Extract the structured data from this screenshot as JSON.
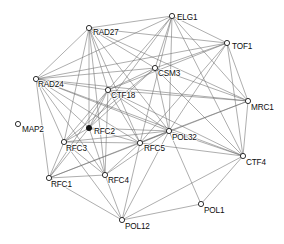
{
  "graph": {
    "title": "Gene interaction network",
    "type": "node-link-graph",
    "canvas": {
      "width": 284,
      "height": 244
    },
    "style": {
      "edge_color": "#6b6b6b",
      "node_stroke": "#1a1a1a",
      "node_fill": "#ffffff",
      "node_fill_highlight": "#111111",
      "background": "#ffffff",
      "node_radius": 2.6,
      "label_font_size": 8.2
    },
    "nodes": [
      {
        "id": "ELG1",
        "label": "ELG1",
        "x": 172,
        "y": 16,
        "filled": false,
        "label_dx": 5,
        "label_dy": 4
      },
      {
        "id": "RAD27",
        "label": "RAD27",
        "x": 89,
        "y": 28,
        "filled": false,
        "label_dx": 4,
        "label_dy": 7
      },
      {
        "id": "TOF1",
        "label": "TOF1",
        "x": 227,
        "y": 43,
        "filled": false,
        "label_dx": 5,
        "label_dy": 6
      },
      {
        "id": "CSM3",
        "label": "CSM3",
        "x": 155,
        "y": 68,
        "filled": false,
        "label_dx": 3,
        "label_dy": 8
      },
      {
        "id": "RAD24",
        "label": "RAD24",
        "x": 36,
        "y": 79,
        "filled": false,
        "label_dx": 2,
        "label_dy": 8
      },
      {
        "id": "CTF18",
        "label": "CTF18",
        "x": 108,
        "y": 90,
        "filled": false,
        "label_dx": 3,
        "label_dy": 8
      },
      {
        "id": "MRC1",
        "label": "MRC1",
        "x": 248,
        "y": 101,
        "filled": false,
        "label_dx": 3,
        "label_dy": 9
      },
      {
        "id": "MAP2",
        "label": "MAP2",
        "x": 18,
        "y": 124,
        "filled": false,
        "label_dx": 4,
        "label_dy": 8
      },
      {
        "id": "RFC2",
        "label": "RFC2",
        "x": 89,
        "y": 128,
        "filled": true,
        "label_dx": 5,
        "label_dy": 6
      },
      {
        "id": "POL32",
        "label": "POL32",
        "x": 169,
        "y": 131,
        "filled": false,
        "label_dx": 3,
        "label_dy": 9
      },
      {
        "id": "RFC3",
        "label": "RFC3",
        "x": 64,
        "y": 142,
        "filled": false,
        "label_dx": 2,
        "label_dy": 9
      },
      {
        "id": "RFC5",
        "label": "RFC5",
        "x": 140,
        "y": 143,
        "filled": false,
        "label_dx": 4,
        "label_dy": 8
      },
      {
        "id": "CTF4",
        "label": "CTF4",
        "x": 243,
        "y": 156,
        "filled": false,
        "label_dx": 3,
        "label_dy": 9
      },
      {
        "id": "RFC4",
        "label": "RFC4",
        "x": 105,
        "y": 175,
        "filled": false,
        "label_dx": 3,
        "label_dy": 8
      },
      {
        "id": "RFC1",
        "label": "RFC1",
        "x": 49,
        "y": 178,
        "filled": false,
        "label_dx": 2,
        "label_dy": 9
      },
      {
        "id": "POL1",
        "label": "POL1",
        "x": 201,
        "y": 204,
        "filled": false,
        "label_dx": 3,
        "label_dy": 9
      },
      {
        "id": "POL12",
        "label": "POL12",
        "x": 122,
        "y": 220,
        "filled": false,
        "label_dx": 3,
        "label_dy": 9
      }
    ],
    "edges": [
      [
        "ELG1",
        "RAD27"
      ],
      [
        "ELG1",
        "TOF1"
      ],
      [
        "ELG1",
        "CSM3"
      ],
      [
        "ELG1",
        "RAD24"
      ],
      [
        "ELG1",
        "CTF18"
      ],
      [
        "ELG1",
        "MRC1"
      ],
      [
        "ELG1",
        "POL32"
      ],
      [
        "ELG1",
        "CTF4"
      ],
      [
        "ELG1",
        "RFC5"
      ],
      [
        "ELG1",
        "RFC2"
      ],
      [
        "RAD27",
        "TOF1"
      ],
      [
        "RAD27",
        "CSM3"
      ],
      [
        "RAD27",
        "RAD24"
      ],
      [
        "RAD27",
        "CTF18"
      ],
      [
        "RAD27",
        "MRC1"
      ],
      [
        "RAD27",
        "POL32"
      ],
      [
        "RAD27",
        "RFC3"
      ],
      [
        "RAD27",
        "RFC4"
      ],
      [
        "RAD27",
        "RFC5"
      ],
      [
        "RAD27",
        "RFC2"
      ],
      [
        "TOF1",
        "CSM3"
      ],
      [
        "TOF1",
        "RAD24"
      ],
      [
        "TOF1",
        "CTF18"
      ],
      [
        "TOF1",
        "MRC1"
      ],
      [
        "TOF1",
        "POL32"
      ],
      [
        "TOF1",
        "CTF4"
      ],
      [
        "TOF1",
        "RFC5"
      ],
      [
        "CSM3",
        "RAD24"
      ],
      [
        "CSM3",
        "CTF18"
      ],
      [
        "CSM3",
        "MRC1"
      ],
      [
        "CSM3",
        "POL32"
      ],
      [
        "CSM3",
        "CTF4"
      ],
      [
        "CSM3",
        "RFC2"
      ],
      [
        "CSM3",
        "RFC3"
      ],
      [
        "RAD24",
        "CTF18"
      ],
      [
        "RAD24",
        "MRC1"
      ],
      [
        "RAD24",
        "POL32"
      ],
      [
        "RAD24",
        "RFC2"
      ],
      [
        "RAD24",
        "RFC3"
      ],
      [
        "RAD24",
        "RFC1"
      ],
      [
        "RAD24",
        "RFC4"
      ],
      [
        "RAD24",
        "RFC5"
      ],
      [
        "RAD24",
        "CTF4"
      ],
      [
        "CTF18",
        "MRC1"
      ],
      [
        "CTF18",
        "POL32"
      ],
      [
        "CTF18",
        "RFC2"
      ],
      [
        "CTF18",
        "RFC3"
      ],
      [
        "CTF18",
        "RFC4"
      ],
      [
        "CTF18",
        "RFC5"
      ],
      [
        "CTF18",
        "CTF4"
      ],
      [
        "CTF18",
        "RFC1"
      ],
      [
        "MRC1",
        "POL32"
      ],
      [
        "MRC1",
        "CTF4"
      ],
      [
        "MRC1",
        "RFC5"
      ],
      [
        "POL32",
        "CTF4"
      ],
      [
        "POL32",
        "RFC5"
      ],
      [
        "POL32",
        "RFC2"
      ],
      [
        "POL32",
        "RFC3"
      ],
      [
        "POL32",
        "RFC4"
      ],
      [
        "POL32",
        "POL12"
      ],
      [
        "POL32",
        "POL1"
      ],
      [
        "POL32",
        "RFC1"
      ],
      [
        "RFC2",
        "RFC3"
      ],
      [
        "RFC2",
        "RFC4"
      ],
      [
        "RFC2",
        "RFC5"
      ],
      [
        "RFC2",
        "RFC1"
      ],
      [
        "RFC3",
        "RFC5"
      ],
      [
        "RFC3",
        "RFC4"
      ],
      [
        "RFC3",
        "RFC1"
      ],
      [
        "RFC3",
        "POL12"
      ],
      [
        "RFC5",
        "RFC4"
      ],
      [
        "RFC5",
        "RFC1"
      ],
      [
        "RFC5",
        "POL12"
      ],
      [
        "RFC5",
        "CTF4"
      ],
      [
        "RFC4",
        "RFC1"
      ],
      [
        "RFC4",
        "POL12"
      ],
      [
        "RFC1",
        "POL12"
      ],
      [
        "CTF4",
        "POL1"
      ],
      [
        "CTF4",
        "POL12"
      ],
      [
        "POL1",
        "POL12"
      ]
    ]
  }
}
